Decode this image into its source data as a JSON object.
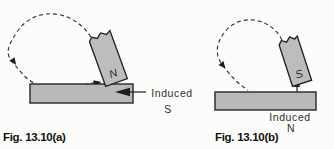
{
  "figure_a": {
    "caption": "Fig. 13.10(a)",
    "magnet_pole": "N",
    "induced_label": "Induced",
    "induced_pole": "S"
  },
  "figure_b": {
    "caption": "Fig. 13.10(b)",
    "magnet_pole": "S",
    "induced_label": "Induced",
    "induced_pole": "N"
  },
  "colors": {
    "background": "#fcfcfa",
    "bar_fill": "#b9b9b9",
    "magnet_fill": "#bdbdbd",
    "outline": "#262626",
    "dashed_line": "#2a2a2a",
    "text": "#2e2e2e"
  }
}
